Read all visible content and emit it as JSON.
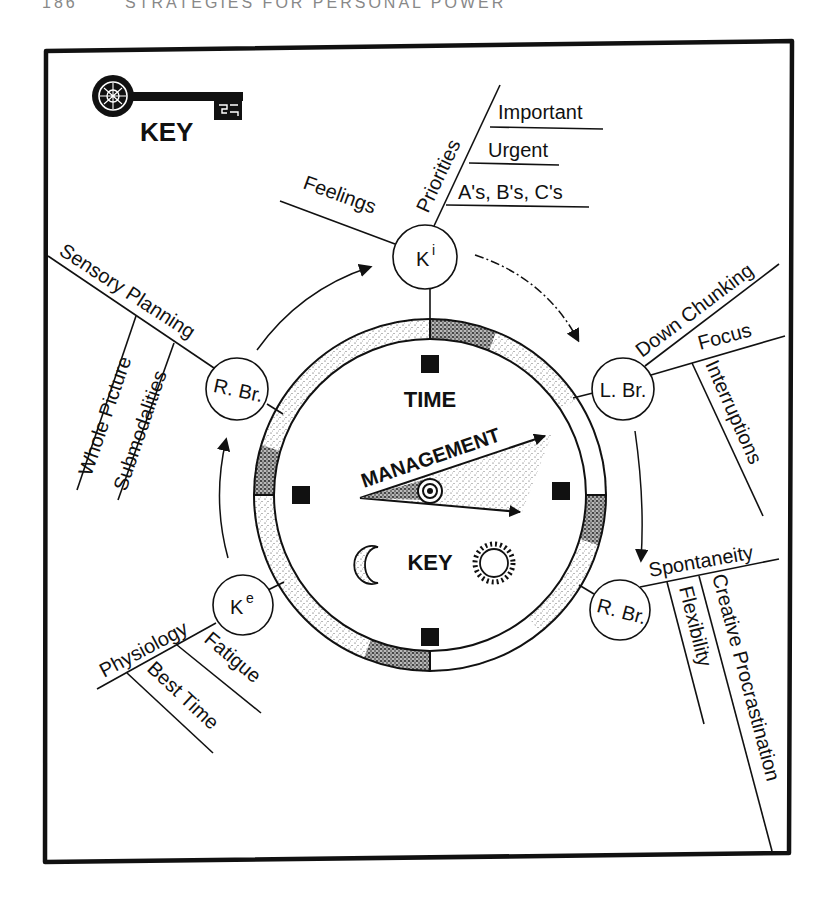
{
  "diagram": {
    "title_fragment": "STRATEGIES FOR PERSONAL POWER",
    "page_number": "186",
    "key_logo": {
      "icon": "skeleton-key-icon",
      "label": "KEY"
    },
    "clock": {
      "top_label": "TIME",
      "hand_label": "MANAGEMENT",
      "bottom_label": "KEY",
      "icons": [
        "moon-icon",
        "sun-icon"
      ]
    },
    "nodes": [
      {
        "id": "ki",
        "label": "K",
        "sup": "i",
        "branches": [
          {
            "label": "Feelings",
            "children": []
          },
          {
            "label": "Priorities",
            "children": [
              "Important",
              "Urgent",
              "A's, B's, C's"
            ]
          }
        ]
      },
      {
        "id": "l-br",
        "label": "L. Br.",
        "branches": [
          {
            "label": "Down Chunking",
            "children": []
          },
          {
            "label": "Focus",
            "children": [
              "Interruptions"
            ]
          }
        ]
      },
      {
        "id": "r-br-right",
        "label": "R. Br.",
        "branches": [
          {
            "label": "Spontaneity",
            "children": [
              "Flexibility",
              "Creative Procrastination"
            ]
          }
        ]
      },
      {
        "id": "ke",
        "label": "K",
        "sup": "e",
        "branches": [
          {
            "label": "Physiology",
            "children": [
              "Fatigue",
              "Best Time"
            ]
          }
        ]
      },
      {
        "id": "r-br-left",
        "label": "R. Br.",
        "branches": [
          {
            "label": "Sensory Planning",
            "children": [
              "Whole Picture",
              "Submodalities"
            ]
          }
        ]
      }
    ],
    "cycle_arrows": [
      "Ki → L. Br.",
      "L. Br. → R. Br.",
      "Ke → R. Br.",
      "R. Br. → Ki"
    ],
    "colors": {
      "ink": "#111111",
      "paper": "#ffffff",
      "stipple": "#555555"
    }
  }
}
